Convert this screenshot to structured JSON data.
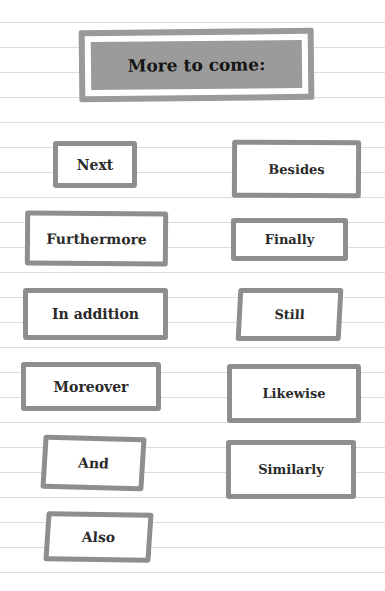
{
  "title": "More to come:",
  "words": [
    {
      "label": "Next"
    },
    {
      "label": "Besides"
    },
    {
      "label": "Furthermore"
    },
    {
      "label": "Finally"
    },
    {
      "label": "In addition"
    },
    {
      "label": "Still"
    },
    {
      "label": "Moreover"
    },
    {
      "label": "Likewise"
    },
    {
      "label": "And"
    },
    {
      "label": "Similarly"
    },
    {
      "label": "Also"
    }
  ],
  "colors": {
    "box_border": "#8e8e8e",
    "title_fill": "#9b9b9b",
    "ruled_line": "#dcdcdc"
  }
}
